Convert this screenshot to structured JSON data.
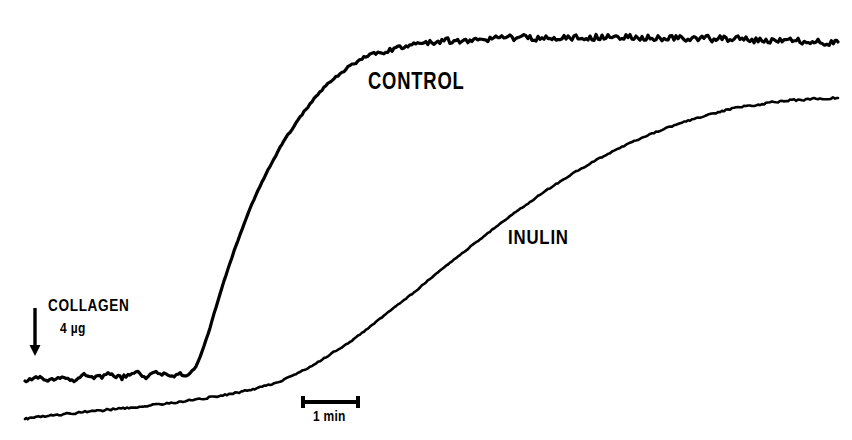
{
  "figure": {
    "background_color": "#ffffff",
    "ink_color": "#000000",
    "width": 852,
    "height": 440
  },
  "annotations": {
    "control_label": "CONTROL",
    "inulin_label": "INULIN",
    "collagen_label": "COLLAGEN",
    "collagen_dose": "4 µg",
    "scalebar_label": "1 min",
    "arrow_icon": "down-arrow-icon"
  },
  "chart_data": {
    "type": "line",
    "title": "",
    "subtitle": "",
    "xlabel": "",
    "ylabel": "",
    "grid": false,
    "legend_position": "inline-annotation",
    "axis_visible": false,
    "xlim": [
      0,
      852
    ],
    "ylim": [
      440,
      0
    ],
    "scalebar": {
      "label": "1 min",
      "x_start": 303,
      "x_end": 358,
      "y": 402,
      "cap_height": 12,
      "pixels_per_unit": 55,
      "unit": "min"
    },
    "stimulus_marker": {
      "label": "COLLAGEN",
      "dose": "4 µg",
      "arrow_x": 35,
      "arrow_y_top": 308,
      "arrow_y_bottom": 356
    },
    "series": [
      {
        "name": "CONTROL",
        "color": "#000000",
        "line_width": 3.2,
        "noise_amplitude": 4.0,
        "label_x": 368,
        "label_y": 70,
        "baseline_y": 378,
        "plateau_y": 41,
        "onset_x": 192,
        "points": [
          [
            25,
            381
          ],
          [
            38,
            377
          ],
          [
            50,
            380
          ],
          [
            62,
            376
          ],
          [
            74,
            379
          ],
          [
            86,
            375
          ],
          [
            98,
            378
          ],
          [
            110,
            374
          ],
          [
            122,
            377
          ],
          [
            134,
            373
          ],
          [
            146,
            376
          ],
          [
            158,
            374
          ],
          [
            170,
            375
          ],
          [
            182,
            373
          ],
          [
            190,
            372
          ],
          [
            196,
            366
          ],
          [
            202,
            352
          ],
          [
            208,
            334
          ],
          [
            214,
            314
          ],
          [
            220,
            294
          ],
          [
            226,
            275
          ],
          [
            232,
            257
          ],
          [
            238,
            240
          ],
          [
            244,
            224
          ],
          [
            250,
            209
          ],
          [
            256,
            195
          ],
          [
            262,
            182
          ],
          [
            268,
            170
          ],
          [
            274,
            159
          ],
          [
            280,
            148
          ],
          [
            286,
            138
          ],
          [
            292,
            129
          ],
          [
            298,
            120
          ],
          [
            304,
            112
          ],
          [
            310,
            104
          ],
          [
            316,
            97
          ],
          [
            322,
            90
          ],
          [
            330,
            82
          ],
          [
            338,
            75
          ],
          [
            346,
            69
          ],
          [
            354,
            64
          ],
          [
            362,
            59
          ],
          [
            372,
            55
          ],
          [
            382,
            52
          ],
          [
            394,
            49
          ],
          [
            406,
            46
          ],
          [
            420,
            44
          ],
          [
            436,
            42
          ],
          [
            452,
            41
          ],
          [
            470,
            40
          ],
          [
            490,
            39
          ],
          [
            512,
            38
          ],
          [
            536,
            38
          ],
          [
            560,
            37
          ],
          [
            584,
            37
          ],
          [
            608,
            37
          ],
          [
            632,
            37
          ],
          [
            656,
            38
          ],
          [
            680,
            38
          ],
          [
            704,
            39
          ],
          [
            728,
            39
          ],
          [
            752,
            40
          ],
          [
            776,
            41
          ],
          [
            800,
            41
          ],
          [
            820,
            42
          ],
          [
            838,
            42
          ]
        ]
      },
      {
        "name": "INULIN",
        "color": "#000000",
        "line_width": 2.6,
        "noise_amplitude": 1.4,
        "label_x": 508,
        "label_y": 226,
        "baseline_y": 417,
        "plateau_y": 98,
        "onset_x": 250,
        "points": [
          [
            25,
            419
          ],
          [
            45,
            416
          ],
          [
            65,
            414
          ],
          [
            85,
            412
          ],
          [
            105,
            410
          ],
          [
            125,
            408
          ],
          [
            145,
            406
          ],
          [
            165,
            404
          ],
          [
            185,
            401
          ],
          [
            205,
            398
          ],
          [
            225,
            395
          ],
          [
            245,
            391
          ],
          [
            262,
            387
          ],
          [
            278,
            382
          ],
          [
            292,
            376
          ],
          [
            306,
            369
          ],
          [
            320,
            361
          ],
          [
            334,
            352
          ],
          [
            348,
            343
          ],
          [
            362,
            333
          ],
          [
            376,
            322
          ],
          [
            390,
            311
          ],
          [
            404,
            300
          ],
          [
            418,
            289
          ],
          [
            432,
            277
          ],
          [
            446,
            266
          ],
          [
            460,
            255
          ],
          [
            474,
            244
          ],
          [
            488,
            233
          ],
          [
            502,
            222
          ],
          [
            516,
            212
          ],
          [
            530,
            202
          ],
          [
            544,
            192
          ],
          [
            558,
            183
          ],
          [
            572,
            174
          ],
          [
            586,
            166
          ],
          [
            600,
            158
          ],
          [
            614,
            151
          ],
          [
            628,
            144
          ],
          [
            642,
            138
          ],
          [
            656,
            132
          ],
          [
            670,
            127
          ],
          [
            684,
            122
          ],
          [
            698,
            118
          ],
          [
            712,
            114
          ],
          [
            726,
            110
          ],
          [
            740,
            107
          ],
          [
            754,
            105
          ],
          [
            768,
            103
          ],
          [
            782,
            101
          ],
          [
            796,
            100
          ],
          [
            810,
            99
          ],
          [
            824,
            98
          ],
          [
            838,
            98
          ]
        ]
      }
    ]
  }
}
